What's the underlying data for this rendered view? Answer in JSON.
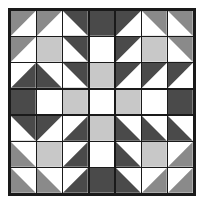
{
  "figure": {
    "rows": 7,
    "columns": 7
  },
  "palette": {
    "dark": "#4a4a4a",
    "medium": "#8a8a8a",
    "light": "#c8c8c8",
    "white": "#ffffff",
    "seam": "#1a1a1a",
    "background": "#ffffff"
  },
  "chart_data": {
    "type": "heatmap",
    "xlabel": "",
    "ylabel": "",
    "categories": [
      "c0",
      "c1",
      "c2",
      "c3",
      "c4",
      "c5",
      "c6"
    ],
    "rows": 7,
    "columns": 7,
    "legend": [
      {
        "name": "dark",
        "color": "#4a4a4a"
      },
      {
        "name": "medium",
        "color": "#8a8a8a"
      },
      {
        "name": "light",
        "color": "#c8c8c8"
      },
      {
        "name": "white",
        "color": "#ffffff"
      }
    ],
    "cells": [
      [
        {
          "style": "half",
          "diagonal": "tl-br",
          "a": "medium",
          "b": "white"
        },
        {
          "style": "half",
          "diagonal": "tl-br",
          "a": "medium",
          "b": "white"
        },
        {
          "style": "half",
          "diagonal": "bl-tr",
          "a": "white",
          "b": "dark"
        },
        {
          "style": "solid",
          "a": "dark",
          "b": "dark"
        },
        {
          "style": "half",
          "diagonal": "tl-br",
          "a": "dark",
          "b": "white"
        },
        {
          "style": "half",
          "diagonal": "bl-tr",
          "a": "white",
          "b": "medium"
        },
        {
          "style": "half",
          "diagonal": "bl-tr",
          "a": "white",
          "b": "medium"
        }
      ],
      [
        {
          "style": "half",
          "diagonal": "tl-br",
          "a": "medium",
          "b": "white"
        },
        {
          "style": "solid",
          "a": "light",
          "b": "light"
        },
        {
          "style": "half",
          "diagonal": "bl-tr",
          "a": "white",
          "b": "dark"
        },
        {
          "style": "solid",
          "a": "white",
          "b": "white"
        },
        {
          "style": "half",
          "diagonal": "tl-br",
          "a": "dark",
          "b": "white"
        },
        {
          "style": "solid",
          "a": "light",
          "b": "light"
        },
        {
          "style": "half",
          "diagonal": "bl-tr",
          "a": "white",
          "b": "medium"
        }
      ],
      [
        {
          "style": "half",
          "diagonal": "tl-br",
          "a": "white",
          "b": "dark"
        },
        {
          "style": "half",
          "diagonal": "bl-tr",
          "a": "dark",
          "b": "white"
        },
        {
          "style": "half",
          "diagonal": "bl-tr",
          "a": "white",
          "b": "dark"
        },
        {
          "style": "solid",
          "a": "light",
          "b": "light"
        },
        {
          "style": "half",
          "diagonal": "tl-br",
          "a": "dark",
          "b": "white"
        },
        {
          "style": "half",
          "diagonal": "tl-br",
          "a": "dark",
          "b": "white"
        },
        {
          "style": "half",
          "diagonal": "tl-br",
          "a": "dark",
          "b": "white"
        }
      ],
      [
        {
          "style": "solid",
          "a": "dark",
          "b": "dark"
        },
        {
          "style": "solid",
          "a": "white",
          "b": "white"
        },
        {
          "style": "solid",
          "a": "light",
          "b": "light"
        },
        {
          "style": "solid",
          "a": "white",
          "b": "white"
        },
        {
          "style": "solid",
          "a": "light",
          "b": "light"
        },
        {
          "style": "solid",
          "a": "white",
          "b": "white"
        },
        {
          "style": "solid",
          "a": "dark",
          "b": "dark"
        }
      ],
      [
        {
          "style": "half",
          "diagonal": "bl-tr",
          "a": "white",
          "b": "dark"
        },
        {
          "style": "half",
          "diagonal": "tl-br",
          "a": "dark",
          "b": "white"
        },
        {
          "style": "half",
          "diagonal": "tl-br",
          "a": "white",
          "b": "dark"
        },
        {
          "style": "solid",
          "a": "light",
          "b": "light"
        },
        {
          "style": "half",
          "diagonal": "bl-tr",
          "a": "dark",
          "b": "white"
        },
        {
          "style": "half",
          "diagonal": "bl-tr",
          "a": "dark",
          "b": "white"
        },
        {
          "style": "half",
          "diagonal": "bl-tr",
          "a": "dark",
          "b": "white"
        }
      ],
      [
        {
          "style": "half",
          "diagonal": "bl-tr",
          "a": "medium",
          "b": "white"
        },
        {
          "style": "solid",
          "a": "light",
          "b": "light"
        },
        {
          "style": "half",
          "diagonal": "tl-br",
          "a": "white",
          "b": "dark"
        },
        {
          "style": "solid",
          "a": "white",
          "b": "white"
        },
        {
          "style": "half",
          "diagonal": "bl-tr",
          "a": "dark",
          "b": "white"
        },
        {
          "style": "solid",
          "a": "light",
          "b": "light"
        },
        {
          "style": "half",
          "diagonal": "tl-br",
          "a": "white",
          "b": "medium"
        }
      ],
      [
        {
          "style": "half",
          "diagonal": "bl-tr",
          "a": "medium",
          "b": "white"
        },
        {
          "style": "half",
          "diagonal": "bl-tr",
          "a": "medium",
          "b": "white"
        },
        {
          "style": "half",
          "diagonal": "tl-br",
          "a": "white",
          "b": "dark"
        },
        {
          "style": "solid",
          "a": "dark",
          "b": "dark"
        },
        {
          "style": "half",
          "diagonal": "bl-tr",
          "a": "dark",
          "b": "white"
        },
        {
          "style": "half",
          "diagonal": "tl-br",
          "a": "white",
          "b": "medium"
        },
        {
          "style": "half",
          "diagonal": "tl-br",
          "a": "white",
          "b": "medium"
        }
      ]
    ]
  }
}
